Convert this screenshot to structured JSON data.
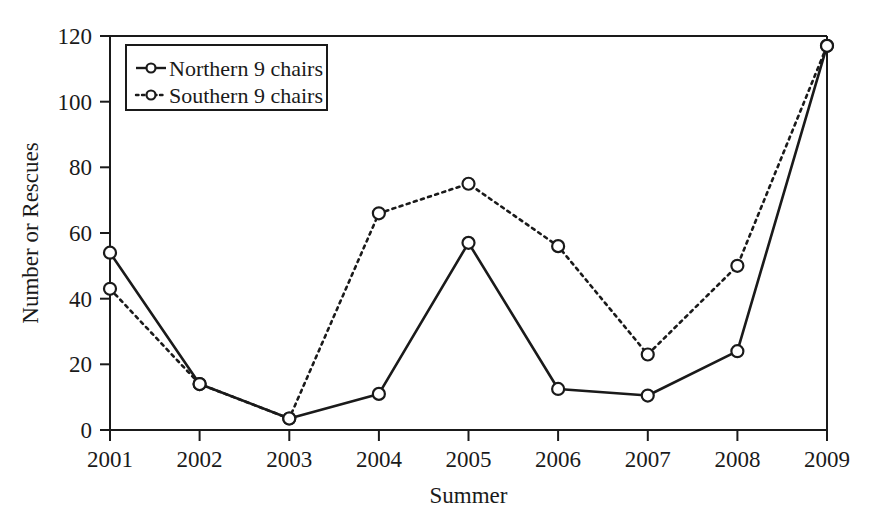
{
  "chart_data": {
    "type": "line",
    "title": "",
    "xlabel": "Summer",
    "ylabel": "Number or Rescues",
    "categories": [
      "2001",
      "2002",
      "2003",
      "2004",
      "2005",
      "2006",
      "2007",
      "2008",
      "2009"
    ],
    "x": [
      2001,
      2002,
      2003,
      2004,
      2005,
      2006,
      2007,
      2008,
      2009
    ],
    "xlim": [
      2001,
      2009
    ],
    "ylim": [
      0,
      120
    ],
    "yticks": [
      0,
      20,
      40,
      60,
      80,
      100,
      120
    ],
    "ytick_labels": [
      "0",
      "20",
      "40",
      "60",
      "80",
      "100",
      "120"
    ],
    "xticks": [
      2001,
      2002,
      2003,
      2004,
      2005,
      2006,
      2007,
      2008,
      2009
    ],
    "xtick_labels": [
      "2001",
      "2002",
      "2003",
      "2004",
      "2005",
      "2006",
      "2007",
      "2008",
      "2009"
    ],
    "grid": false,
    "legend_position": "upper left",
    "series": [
      {
        "name": "Northern 9 chairs",
        "style": "solid",
        "marker": "circle",
        "color": "#1a1a1a",
        "values": [
          54,
          14,
          3.5,
          11,
          57,
          12.5,
          10.5,
          24,
          117
        ]
      },
      {
        "name": "Southern 9 chairs",
        "style": "dotted",
        "marker": "circle",
        "color": "#1a1a1a",
        "values": [
          43,
          14,
          3.5,
          66,
          75,
          56,
          23,
          50,
          117
        ]
      }
    ]
  },
  "axes": {
    "y_title": "Number or Rescues",
    "x_title": "Summer"
  },
  "legend": {
    "entries": [
      {
        "label": "Northern 9 chairs",
        "style": "solid"
      },
      {
        "label": "Southern 9 chairs",
        "style": "dotted"
      }
    ]
  },
  "colors": {
    "background": "#ffffff",
    "ink": "#1a1a1a"
  }
}
